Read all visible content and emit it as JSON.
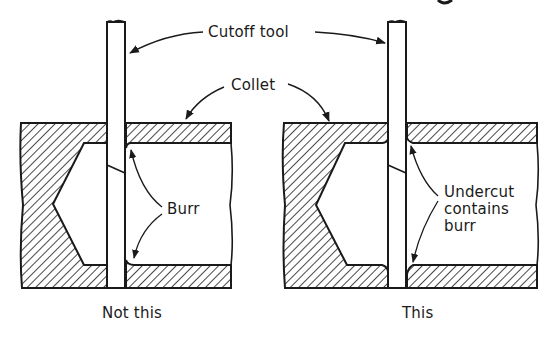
{
  "diagram": {
    "labels": {
      "cutoff_tool": "Cutoff tool",
      "collet": "Collet",
      "burr": "Burr",
      "undercut": "Undercut\ncontains\nburr"
    },
    "captions": {
      "left": "Not this",
      "right": "This"
    },
    "colors": {
      "ink": "#1a1a1a",
      "background": "#ffffff"
    }
  }
}
